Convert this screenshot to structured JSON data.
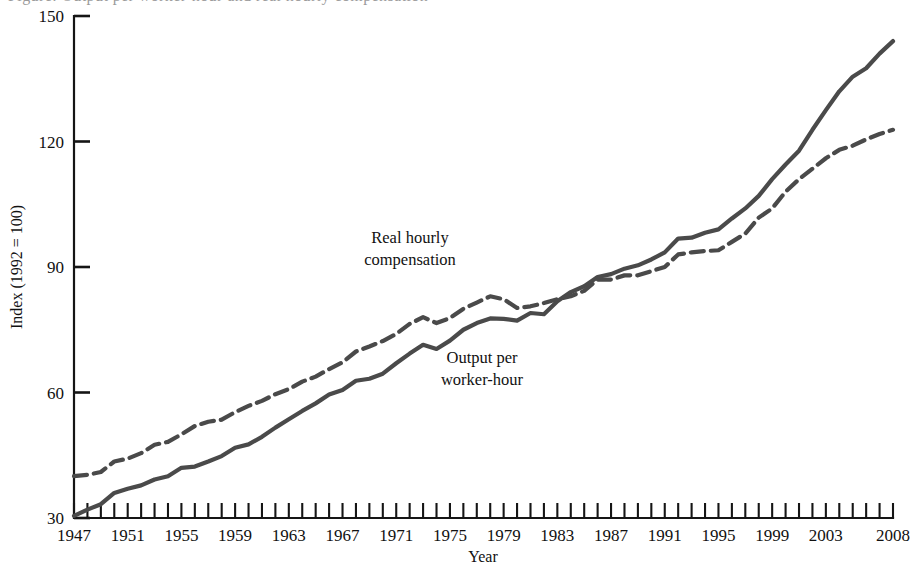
{
  "figure": {
    "title_fragment": "Figure: Output per worker-hour and real hourly compensation",
    "background_color": "#ffffff",
    "line_color": "#4a4a4a",
    "axis_color": "#151515"
  },
  "chart_data": {
    "type": "line",
    "title": "",
    "xlabel": "Year",
    "ylabel": "Index (1992 = 100)",
    "xlim": [
      1947,
      2008
    ],
    "ylim": [
      30,
      150
    ],
    "grid": false,
    "legend_position": "inline-annotations",
    "y_ticks": [
      30,
      60,
      90,
      120,
      150
    ],
    "y_tick_labels": [
      "30",
      "60",
      "90",
      "120",
      "150"
    ],
    "x_ticks": [
      1947,
      1948,
      1949,
      1950,
      1951,
      1952,
      1953,
      1954,
      1955,
      1956,
      1957,
      1958,
      1959,
      1960,
      1961,
      1962,
      1963,
      1964,
      1965,
      1966,
      1967,
      1968,
      1969,
      1970,
      1971,
      1972,
      1973,
      1974,
      1975,
      1976,
      1977,
      1978,
      1979,
      1980,
      1981,
      1982,
      1983,
      1984,
      1985,
      1986,
      1987,
      1988,
      1989,
      1990,
      1991,
      1992,
      1993,
      1994,
      1995,
      1996,
      1997,
      1998,
      1999,
      2000,
      2001,
      2002,
      2003,
      2004,
      2005,
      2006,
      2007,
      2008
    ],
    "x_tick_labels": [
      "1947",
      "1951",
      "1955",
      "1959",
      "1963",
      "1967",
      "1971",
      "1975",
      "1979",
      "1983",
      "1987",
      "1991",
      "1995",
      "1999",
      "2003",
      "2008"
    ],
    "x_tick_label_years": [
      1947,
      1951,
      1955,
      1959,
      1963,
      1967,
      1971,
      1975,
      1979,
      1983,
      1987,
      1991,
      1995,
      1999,
      2003,
      2008
    ],
    "x": [
      1947,
      1948,
      1949,
      1950,
      1951,
      1952,
      1953,
      1954,
      1955,
      1956,
      1957,
      1958,
      1959,
      1960,
      1961,
      1962,
      1963,
      1964,
      1965,
      1966,
      1967,
      1968,
      1969,
      1970,
      1971,
      1972,
      1973,
      1974,
      1975,
      1976,
      1977,
      1978,
      1979,
      1980,
      1981,
      1982,
      1983,
      1984,
      1985,
      1986,
      1987,
      1988,
      1989,
      1990,
      1991,
      1992,
      1993,
      1994,
      1995,
      1996,
      1997,
      1998,
      1999,
      2000,
      2001,
      2002,
      2003,
      2004,
      2005,
      2006,
      2007,
      2008
    ],
    "series": [
      {
        "name": "Output per worker-hour",
        "style": "solid",
        "color": "#4a4a4a",
        "annotation": "Output per\nworker-hour",
        "values": [
          30.5,
          32.0,
          33.3,
          36.0,
          37.0,
          37.8,
          39.2,
          40.0,
          42.0,
          42.3,
          43.5,
          44.8,
          46.8,
          47.6,
          49.4,
          51.6,
          53.6,
          55.6,
          57.4,
          59.5,
          60.6,
          62.8,
          63.3,
          64.5,
          67.0,
          69.3,
          71.4,
          70.4,
          72.4,
          75.0,
          76.6,
          77.7,
          77.6,
          77.2,
          79.0,
          78.7,
          81.8,
          84.0,
          85.4,
          87.6,
          88.3,
          89.6,
          90.4,
          91.8,
          93.5,
          96.8,
          97.0,
          98.2,
          99.0,
          101.6,
          104.0,
          107.0,
          111.0,
          114.5,
          117.8,
          122.8,
          127.5,
          132.0,
          135.5,
          137.5,
          141.0,
          144.0
        ]
      },
      {
        "name": "Real hourly compensation",
        "style": "dashed",
        "color": "#4a4a4a",
        "annotation": "Real hourly\ncompensation",
        "values": [
          40.0,
          40.3,
          41.0,
          43.5,
          44.2,
          45.5,
          47.5,
          48.2,
          50.0,
          52.0,
          53.0,
          53.5,
          55.3,
          56.8,
          58.0,
          59.6,
          60.8,
          62.6,
          63.8,
          65.6,
          67.2,
          69.8,
          71.0,
          72.3,
          74.0,
          76.4,
          78.0,
          76.6,
          77.8,
          80.0,
          81.5,
          83.0,
          82.3,
          80.2,
          80.6,
          81.4,
          82.3,
          83.0,
          84.3,
          87.0,
          87.0,
          88.0,
          88.0,
          89.0,
          90.0,
          93.0,
          93.5,
          93.8,
          94.0,
          96.0,
          98.0,
          101.8,
          104.0,
          108.0,
          111.0,
          113.5,
          116.0,
          118.0,
          119.0,
          120.5,
          121.8,
          122.8
        ]
      }
    ]
  },
  "annotations": [
    {
      "id": "real-hourly-compensation",
      "line1": "Real hourly",
      "line2": "compensation",
      "x": 410,
      "y": 243
    },
    {
      "id": "output-per-worker-hour",
      "line1": "Output per",
      "line2": "worker-hour",
      "x": 482,
      "y": 363
    }
  ],
  "axis_titles": {
    "x": "Year",
    "y": "Index (1992 = 100)"
  }
}
